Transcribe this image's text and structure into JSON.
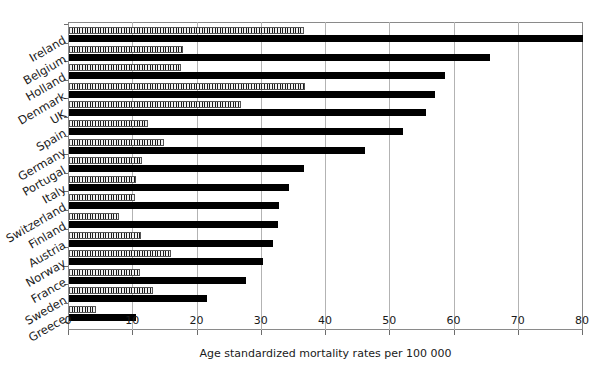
{
  "chart_data": {
    "type": "bar",
    "orientation": "horizontal",
    "title": "",
    "xlabel": "Age standardized mortality rates per 100 000",
    "ylabel": "",
    "xlim": [
      0,
      80
    ],
    "xticks": [
      0,
      10,
      20,
      30,
      40,
      50,
      60,
      70,
      80
    ],
    "xticklabels": [
      "0",
      "10",
      "20",
      "30",
      "40",
      "50",
      "60",
      "70",
      "80"
    ],
    "grid": true,
    "grid_axis": "x",
    "legend": null,
    "categories": [
      "Ireland",
      "Belgium",
      "Holland",
      "Denmark",
      "UK",
      "Spain",
      "Germany",
      "Portugal",
      "Italy",
      "Switzerland",
      "Finland",
      "Austria",
      "Norway",
      "France",
      "Sweden",
      "Greece"
    ],
    "series": [
      {
        "name": "female",
        "style": "hatched",
        "color": "#f2f2f2",
        "values": [
          36.5,
          17.7,
          17.5,
          36.8,
          26.8,
          12.3,
          14.8,
          11.3,
          10.5,
          10.3,
          7.8,
          11.2,
          15.8,
          11.0,
          13.0,
          4.2
        ]
      },
      {
        "name": "male",
        "style": "solid",
        "color": "#000000",
        "values": [
          80.0,
          65.5,
          58.5,
          57.0,
          55.5,
          52.0,
          46.0,
          36.5,
          34.2,
          32.7,
          32.5,
          31.8,
          30.2,
          27.5,
          21.5,
          10.5
        ]
      }
    ]
  },
  "colors": {
    "male_bar": "#000000",
    "female_bar": "#f2f2f2",
    "gridline": "#b3b3b3",
    "axis": "#8a8a8a",
    "text": "#1a1a1a",
    "background": "#ffffff"
  }
}
